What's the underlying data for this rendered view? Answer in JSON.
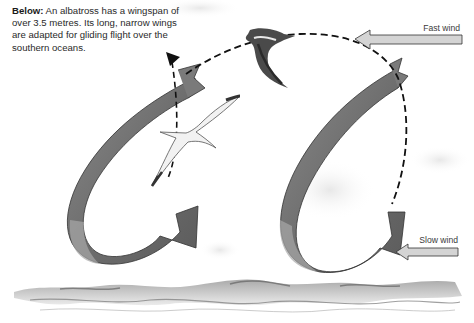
{
  "caption": {
    "lead": "Below:",
    "text": " An albatross has a wingspan of over 3.5 metres. Its long, narrow wings are adapted for gliding flight over the southern oceans."
  },
  "wind": {
    "fast_label": "Fast wind",
    "slow_label": "Slow wind"
  },
  "diagram": {
    "elements": [
      "caption",
      "fast-wind-arrow",
      "slow-wind-arrow",
      "left-loop-ribbon",
      "right-loop-ribbon",
      "dashed-flight-path",
      "albatross-upper",
      "albatross-lower",
      "sea-waves"
    ],
    "colors": {
      "ribbon": "#7a7a7a",
      "ribbon_dark": "#5a5a5a",
      "wind_arrow": "#d4d4d4",
      "text": "#2a2a2a",
      "path": "#111111"
    }
  }
}
